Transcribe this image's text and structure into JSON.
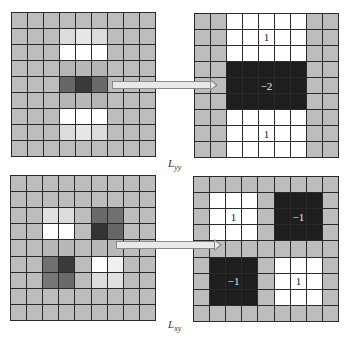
{
  "colors": {
    "background_gray": "#bdbdbd",
    "grid_line": "#2a2a2a",
    "white": "#ffffff",
    "black": "#1e1e1e"
  },
  "panels": [
    {
      "id": "yy-image",
      "position": {
        "left": 11,
        "top": 12,
        "size": 145
      },
      "cells": [
        [
          "#bdbdbd",
          "#bdbdbd",
          "#bdbdbd",
          "#bdbdbd",
          "#bdbdbd",
          "#bdbdbd",
          "#bdbdbd",
          "#bdbdbd",
          "#bdbdbd"
        ],
        [
          "#bdbdbd",
          "#bdbdbd",
          "#bdbdbd",
          "#dcdcdc",
          "#e6e6e6",
          "#dcdcdc",
          "#bdbdbd",
          "#bdbdbd",
          "#bdbdbd"
        ],
        [
          "#bdbdbd",
          "#bdbdbd",
          "#bdbdbd",
          "#ffffff",
          "#ffffff",
          "#ffffff",
          "#bdbdbd",
          "#bdbdbd",
          "#bdbdbd"
        ],
        [
          "#bdbdbd",
          "#bdbdbd",
          "#bdbdbd",
          "#b5b5b5",
          "#b8b8b8",
          "#b5b5b5",
          "#bdbdbd",
          "#bdbdbd",
          "#bdbdbd"
        ],
        [
          "#bdbdbd",
          "#bdbdbd",
          "#bdbdbd",
          "#666666",
          "#3a3a3a",
          "#6a6a6a",
          "#bdbdbd",
          "#bdbdbd",
          "#bdbdbd"
        ],
        [
          "#bdbdbd",
          "#bdbdbd",
          "#bdbdbd",
          "#b5b5b5",
          "#b8b8b8",
          "#b5b5b5",
          "#bdbdbd",
          "#bdbdbd",
          "#bdbdbd"
        ],
        [
          "#bdbdbd",
          "#bdbdbd",
          "#bdbdbd",
          "#ffffff",
          "#ffffff",
          "#ffffff",
          "#bdbdbd",
          "#bdbdbd",
          "#bdbdbd"
        ],
        [
          "#bdbdbd",
          "#bdbdbd",
          "#bdbdbd",
          "#dcdcdc",
          "#e6e6e6",
          "#dcdcdc",
          "#bdbdbd",
          "#bdbdbd",
          "#bdbdbd"
        ],
        [
          "#bdbdbd",
          "#bdbdbd",
          "#bdbdbd",
          "#bdbdbd",
          "#bdbdbd",
          "#bdbdbd",
          "#bdbdbd",
          "#bdbdbd",
          "#bdbdbd"
        ]
      ],
      "labels": []
    },
    {
      "id": "yy-box-filter",
      "position": {
        "left": 194,
        "top": 13,
        "size": 145
      },
      "cells": [
        [
          "#bdbdbd",
          "#bdbdbd",
          "#ffffff",
          "#ffffff",
          "#ffffff",
          "#ffffff",
          "#ffffff",
          "#bdbdbd",
          "#bdbdbd"
        ],
        [
          "#bdbdbd",
          "#bdbdbd",
          "#ffffff",
          "#ffffff",
          "#ffffff",
          "#ffffff",
          "#ffffff",
          "#bdbdbd",
          "#bdbdbd"
        ],
        [
          "#bdbdbd",
          "#bdbdbd",
          "#ffffff",
          "#ffffff",
          "#ffffff",
          "#ffffff",
          "#ffffff",
          "#bdbdbd",
          "#bdbdbd"
        ],
        [
          "#bdbdbd",
          "#bdbdbd",
          "#1e1e1e",
          "#1e1e1e",
          "#1e1e1e",
          "#1e1e1e",
          "#1e1e1e",
          "#bdbdbd",
          "#bdbdbd"
        ],
        [
          "#bdbdbd",
          "#bdbdbd",
          "#1e1e1e",
          "#1e1e1e",
          "#1e1e1e",
          "#1e1e1e",
          "#1e1e1e",
          "#bdbdbd",
          "#bdbdbd"
        ],
        [
          "#bdbdbd",
          "#bdbdbd",
          "#1e1e1e",
          "#1e1e1e",
          "#1e1e1e",
          "#1e1e1e",
          "#1e1e1e",
          "#bdbdbd",
          "#bdbdbd"
        ],
        [
          "#bdbdbd",
          "#bdbdbd",
          "#ffffff",
          "#ffffff",
          "#ffffff",
          "#ffffff",
          "#ffffff",
          "#bdbdbd",
          "#bdbdbd"
        ],
        [
          "#bdbdbd",
          "#bdbdbd",
          "#ffffff",
          "#ffffff",
          "#ffffff",
          "#ffffff",
          "#ffffff",
          "#bdbdbd",
          "#bdbdbd"
        ],
        [
          "#bdbdbd",
          "#bdbdbd",
          "#ffffff",
          "#ffffff",
          "#ffffff",
          "#ffffff",
          "#ffffff",
          "#bdbdbd",
          "#bdbdbd"
        ]
      ],
      "labels": [
        {
          "text": "1",
          "row": 1,
          "col": 4,
          "inverse": false
        },
        {
          "text": "−2",
          "row": 4,
          "col": 4,
          "inverse": true
        },
        {
          "text": "1",
          "row": 7,
          "col": 4,
          "inverse": false
        }
      ]
    },
    {
      "id": "xy-image",
      "position": {
        "left": 10,
        "top": 175,
        "size": 146
      },
      "cells": [
        [
          "#bdbdbd",
          "#bdbdbd",
          "#bdbdbd",
          "#bdbdbd",
          "#bdbdbd",
          "#bdbdbd",
          "#bdbdbd",
          "#bdbdbd",
          "#bdbdbd"
        ],
        [
          "#bdbdbd",
          "#bdbdbd",
          "#bdbdbd",
          "#bdbdbd",
          "#bdbdbd",
          "#bdbdbd",
          "#bdbdbd",
          "#bdbdbd",
          "#bdbdbd"
        ],
        [
          "#bdbdbd",
          "#bdbdbd",
          "#e0e0e0",
          "#dcdcdc",
          "#bdbdbd",
          "#6a6a6a",
          "#707070",
          "#bdbdbd",
          "#bdbdbd"
        ],
        [
          "#bdbdbd",
          "#bdbdbd",
          "#ffffff",
          "#ffffff",
          "#bdbdbd",
          "#333333",
          "#666666",
          "#bdbdbd",
          "#bdbdbd"
        ],
        [
          "#bdbdbd",
          "#bdbdbd",
          "#b8b8b8",
          "#b8b8b8",
          "#bdbdbd",
          "#b8b8b8",
          "#b8b8b8",
          "#bdbdbd",
          "#bdbdbd"
        ],
        [
          "#bdbdbd",
          "#bdbdbd",
          "#707070",
          "#3a3a3a",
          "#bdbdbd",
          "#ffffff",
          "#f0f0f0",
          "#bdbdbd",
          "#bdbdbd"
        ],
        [
          "#bdbdbd",
          "#bdbdbd",
          "#777777",
          "#6a6a6a",
          "#bdbdbd",
          "#dcdcdc",
          "#e0e0e0",
          "#bdbdbd",
          "#bdbdbd"
        ],
        [
          "#bdbdbd",
          "#bdbdbd",
          "#bdbdbd",
          "#bdbdbd",
          "#bdbdbd",
          "#bdbdbd",
          "#bdbdbd",
          "#bdbdbd",
          "#bdbdbd"
        ],
        [
          "#bdbdbd",
          "#bdbdbd",
          "#bdbdbd",
          "#bdbdbd",
          "#bdbdbd",
          "#bdbdbd",
          "#bdbdbd",
          "#bdbdbd",
          "#bdbdbd"
        ]
      ],
      "labels": []
    },
    {
      "id": "xy-box-filter",
      "position": {
        "left": 193,
        "top": 176,
        "size": 146
      },
      "cells": [
        [
          "#bdbdbd",
          "#bdbdbd",
          "#bdbdbd",
          "#bdbdbd",
          "#bdbdbd",
          "#bdbdbd",
          "#bdbdbd",
          "#bdbdbd",
          "#bdbdbd"
        ],
        [
          "#bdbdbd",
          "#ffffff",
          "#ffffff",
          "#ffffff",
          "#bdbdbd",
          "#1e1e1e",
          "#1e1e1e",
          "#1e1e1e",
          "#bdbdbd"
        ],
        [
          "#bdbdbd",
          "#ffffff",
          "#ffffff",
          "#ffffff",
          "#bdbdbd",
          "#1e1e1e",
          "#1e1e1e",
          "#1e1e1e",
          "#bdbdbd"
        ],
        [
          "#bdbdbd",
          "#ffffff",
          "#ffffff",
          "#ffffff",
          "#bdbdbd",
          "#1e1e1e",
          "#1e1e1e",
          "#1e1e1e",
          "#bdbdbd"
        ],
        [
          "#bdbdbd",
          "#bdbdbd",
          "#bdbdbd",
          "#bdbdbd",
          "#bdbdbd",
          "#bdbdbd",
          "#bdbdbd",
          "#bdbdbd",
          "#bdbdbd"
        ],
        [
          "#bdbdbd",
          "#1e1e1e",
          "#1e1e1e",
          "#1e1e1e",
          "#bdbdbd",
          "#ffffff",
          "#ffffff",
          "#ffffff",
          "#bdbdbd"
        ],
        [
          "#bdbdbd",
          "#1e1e1e",
          "#1e1e1e",
          "#1e1e1e",
          "#bdbdbd",
          "#ffffff",
          "#ffffff",
          "#ffffff",
          "#bdbdbd"
        ],
        [
          "#bdbdbd",
          "#1e1e1e",
          "#1e1e1e",
          "#1e1e1e",
          "#bdbdbd",
          "#ffffff",
          "#ffffff",
          "#ffffff",
          "#bdbdbd"
        ],
        [
          "#bdbdbd",
          "#bdbdbd",
          "#bdbdbd",
          "#bdbdbd",
          "#bdbdbd",
          "#bdbdbd",
          "#bdbdbd",
          "#bdbdbd",
          "#bdbdbd"
        ]
      ],
      "labels": [
        {
          "text": "1",
          "row": 2,
          "col": 2,
          "inverse": false
        },
        {
          "text": "−1",
          "row": 2,
          "col": 6,
          "inverse": true
        },
        {
          "text": "−1",
          "row": 6,
          "col": 2,
          "inverse": true
        },
        {
          "text": "1",
          "row": 6,
          "col": 6,
          "inverse": false
        }
      ]
    }
  ],
  "arrows": [
    {
      "id": "arrow-yy",
      "left": 112,
      "top": 81,
      "width": 106
    },
    {
      "id": "arrow-xy",
      "left": 116,
      "top": 241,
      "width": 106
    }
  ],
  "captions": {
    "top": {
      "base": "L",
      "sub": "yy"
    },
    "bottom": {
      "base": "L",
      "sub": "xy"
    }
  }
}
